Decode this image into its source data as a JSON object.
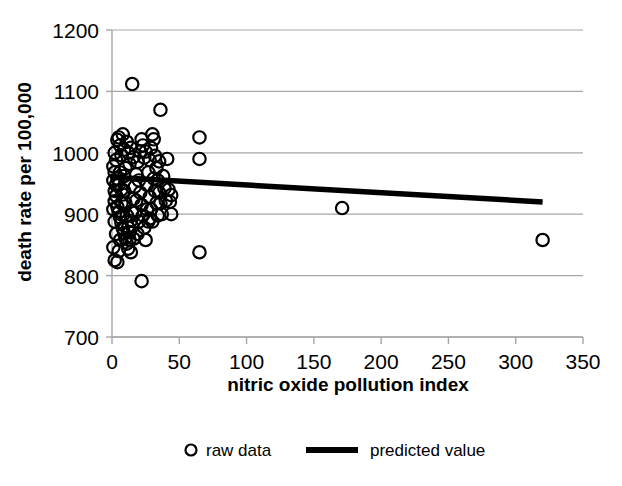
{
  "chart_data": {
    "type": "scatter",
    "title": "",
    "xlabel": "nitric oxide pollution index",
    "ylabel": "death rate per 100,000",
    "xlim": [
      0,
      350
    ],
    "ylim": [
      700,
      1200
    ],
    "xticks": [
      0,
      50,
      100,
      150,
      200,
      250,
      300,
      350
    ],
    "yticks": [
      700,
      800,
      900,
      1000,
      1100,
      1200
    ],
    "xtick_labels": [
      "0",
      "50",
      "100",
      "150",
      "200",
      "250",
      "300",
      "350"
    ],
    "ytick_labels": [
      "700",
      "800",
      "900",
      "1000",
      "1100",
      "1200"
    ],
    "grid": "horizontal",
    "grid_color": "#a6a6a6",
    "marker_color": "#000000",
    "marker_fill": "none",
    "line_color": "#000000",
    "legend_position": "bottom",
    "series": [
      {
        "name": "raw data",
        "type": "scatter",
        "marker": "open-circle",
        "points": [
          [
            4,
            1021
          ],
          [
            5,
            1025
          ],
          [
            6,
            1012
          ],
          [
            8,
            1030
          ],
          [
            7,
            996
          ],
          [
            3,
            988
          ],
          [
            9,
            1005
          ],
          [
            11,
            1018
          ],
          [
            10,
            975
          ],
          [
            6,
            968
          ],
          [
            4,
            958
          ],
          [
            5,
            948
          ],
          [
            7,
            940
          ],
          [
            8,
            932
          ],
          [
            9,
            962
          ],
          [
            12,
            1000
          ],
          [
            13,
            982
          ],
          [
            14,
            1008
          ],
          [
            15,
            1112
          ],
          [
            16,
            993
          ],
          [
            3,
            930
          ],
          [
            2,
            921
          ],
          [
            4,
            912
          ],
          [
            5,
            903
          ],
          [
            6,
            895
          ],
          [
            7,
            886
          ],
          [
            8,
            877
          ],
          [
            9,
            869
          ],
          [
            10,
            861
          ],
          [
            11,
            852
          ],
          [
            12,
            844
          ],
          [
            13,
            871
          ],
          [
            14,
            889
          ],
          [
            15,
            905
          ],
          [
            16,
            925
          ],
          [
            17,
            945
          ],
          [
            18,
            965
          ],
          [
            19,
            985
          ],
          [
            20,
            955
          ],
          [
            21,
            935
          ],
          [
            22,
            915
          ],
          [
            23,
            898
          ],
          [
            24,
            878
          ],
          [
            25,
            858
          ],
          [
            26,
            948
          ],
          [
            27,
            968
          ],
          [
            28,
            988
          ],
          [
            29,
            1008
          ],
          [
            30,
            1030
          ],
          [
            31,
            1022
          ],
          [
            32,
            995
          ],
          [
            33,
            975
          ],
          [
            34,
            955
          ],
          [
            35,
            935
          ],
          [
            36,
            1070
          ],
          [
            36,
            918
          ],
          [
            37,
            900
          ],
          [
            2,
            1000
          ],
          [
            1,
            978
          ],
          [
            1,
            955
          ],
          [
            2,
            938
          ],
          [
            3,
            948
          ],
          [
            2,
            968
          ],
          [
            1,
            908
          ],
          [
            2,
            888
          ],
          [
            3,
            868
          ],
          [
            1,
            846
          ],
          [
            2,
            825
          ],
          [
            4,
            822
          ],
          [
            5,
            840
          ],
          [
            6,
            858
          ],
          [
            7,
            918
          ],
          [
            8,
            898
          ],
          [
            9,
            938
          ],
          [
            10,
            918
          ],
          [
            11,
            898
          ],
          [
            12,
            878
          ],
          [
            13,
            858
          ],
          [
            14,
            838
          ],
          [
            15,
            880
          ],
          [
            16,
            860
          ],
          [
            17,
            902
          ],
          [
            18,
            922
          ],
          [
            19,
            868
          ],
          [
            20,
            888
          ],
          [
            21,
            1002
          ],
          [
            22,
            1022
          ],
          [
            23,
            1012
          ],
          [
            24,
            992
          ],
          [
            25,
            1002
          ],
          [
            26,
            908
          ],
          [
            27,
            888
          ],
          [
            28,
            928
          ],
          [
            29,
            908
          ],
          [
            30,
            888
          ],
          [
            31,
            958
          ],
          [
            32,
            938
          ],
          [
            33,
            918
          ],
          [
            34,
            898
          ],
          [
            35,
            986
          ],
          [
            38,
            962
          ],
          [
            39,
            942
          ],
          [
            40,
            922
          ],
          [
            41,
            990
          ],
          [
            42,
            940
          ],
          [
            43,
            920
          ],
          [
            44,
            900
          ],
          [
            22,
            791
          ],
          [
            28,
            893
          ],
          [
            44,
            931
          ],
          [
            65,
            1025
          ],
          [
            65,
            990
          ],
          [
            65,
            838
          ],
          [
            171,
            910
          ],
          [
            320,
            858
          ]
        ]
      },
      {
        "name": "predicted value",
        "type": "line",
        "points": [
          [
            0,
            960
          ],
          [
            320,
            920
          ]
        ]
      }
    ],
    "legend": [
      {
        "label": "raw data",
        "marker": "open-circle"
      },
      {
        "label": "predicted value",
        "marker": "thick-line"
      }
    ]
  }
}
